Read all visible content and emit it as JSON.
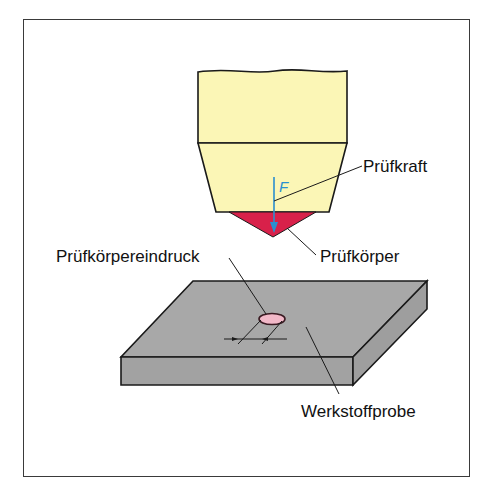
{
  "diagram": {
    "title": "",
    "type": "hardness-test-schematic",
    "labels": {
      "test_force": "Prüfkraft",
      "indenter": "Prüfkörper",
      "indentation": "Prüfkörpereindruck",
      "specimen": "Werkstoffprobe",
      "force_symbol": "F"
    },
    "colors": {
      "indenter_body": "#fbf6b6",
      "indenter_tip": "#d8214a",
      "force_arrow": "#2b8fd0",
      "specimen": "#a8a8a8",
      "specimen_side": "#a2a2a2",
      "indentation": "#f2b8c8",
      "outline": "#1a1a1a",
      "frame": "#3a3a3a"
    }
  }
}
